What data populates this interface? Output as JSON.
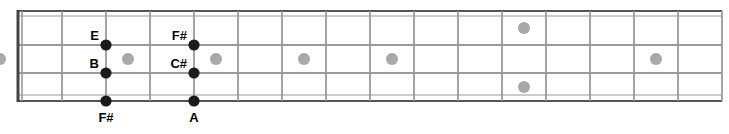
{
  "diagram": {
    "kind": "guitar-fretboard",
    "title": "",
    "geometry": {
      "board_left": 18,
      "board_right": 722,
      "board_top": 11,
      "board_bottom": 101,
      "fret_count": 16,
      "nut_x": 18,
      "string_ys": [
        11,
        45,
        73,
        101
      ],
      "fret_xs": [
        18,
        62,
        106,
        150,
        194,
        238,
        282,
        326,
        370,
        414,
        458,
        502,
        546,
        590,
        634,
        678,
        722
      ]
    },
    "colors": {
      "board_line": "#9a9a9a",
      "board_edge": "#555555",
      "nut": "#444444",
      "note_dot": "#1a1a1a",
      "inlay_dot": "#a9a9a9",
      "label_text": "#000000",
      "background": "#ffffff"
    },
    "inlays": [
      {
        "fret": 3,
        "row": "middle",
        "double": false
      },
      {
        "fret": 5,
        "row": "middle",
        "double": false
      },
      {
        "fret": 7,
        "row": "middle",
        "double": false
      },
      {
        "fret": 9,
        "row": "middle",
        "double": false
      },
      {
        "fret": 12,
        "row": "double",
        "double": true
      },
      {
        "fret": 15,
        "row": "middle",
        "double": false
      },
      {
        "fret": 17,
        "row": "middle",
        "double": false
      }
    ],
    "notes": [
      {
        "label": "E",
        "fret": 2,
        "string": 1,
        "label_pos": "above-left"
      },
      {
        "label": "B",
        "fret": 2,
        "string": 2,
        "label_pos": "above-left"
      },
      {
        "label": "F#",
        "fret": 2,
        "string": 3,
        "label_pos": "below"
      },
      {
        "label": "F#",
        "fret": 4,
        "string": 1,
        "label_pos": "above-left"
      },
      {
        "label": "C#",
        "fret": 4,
        "string": 2,
        "label_pos": "above-left"
      },
      {
        "label": "A",
        "fret": 4,
        "string": 3,
        "label_pos": "below"
      }
    ],
    "note_labels": {
      "e": "E",
      "b": "B",
      "fsharp_low": "F#",
      "fsharp_high": "F#",
      "csharp": "C#",
      "a": "A"
    }
  }
}
